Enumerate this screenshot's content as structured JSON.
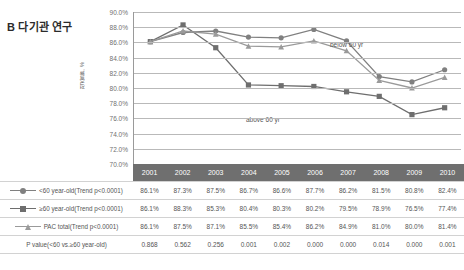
{
  "panel": {
    "title": "B 다기관 연구"
  },
  "chart_data": {
    "type": "line",
    "title": "B 다기관 연구",
    "xlabel": "",
    "ylabel": "적중률, %",
    "ylim": [
      70,
      90
    ],
    "ytick_step": 2,
    "ytick_labels": [
      "90.0%",
      "88.0%",
      "86.0%",
      "84.0%",
      "82.0%",
      "80.0%",
      "78.0%",
      "76.0%",
      "74.0%",
      "72.0%",
      "70.0%"
    ],
    "grid": true,
    "legend_position": "table-rows",
    "categories": [
      "2001",
      "2002",
      "2003",
      "2004",
      "2005",
      "2006",
      "2007",
      "2008",
      "2009",
      "2010"
    ],
    "series": [
      {
        "name": "<60 year-old(Trend p<0.0001)",
        "marker": "circle",
        "color": "#808080",
        "values": [
          86.1,
          87.3,
          87.5,
          86.7,
          86.6,
          87.7,
          86.2,
          81.5,
          80.8,
          82.4
        ],
        "display_values": [
          "86.1%",
          "87.3%",
          "87.5%",
          "86.7%",
          "86.6%",
          "87.7%",
          "86.2%",
          "81.5%",
          "80.8%",
          "82.4%"
        ]
      },
      {
        "name": "≥60 year-old(Trend p<0.0001)",
        "marker": "square",
        "color": "#6e6e6e",
        "values": [
          86.1,
          88.3,
          85.3,
          80.4,
          80.3,
          80.2,
          79.5,
          78.9,
          76.5,
          77.4
        ],
        "display_values": [
          "86.1%",
          "88.3%",
          "85.3%",
          "80.4%",
          "80.3%",
          "80.2%",
          "79.5%",
          "78.9%",
          "76.5%",
          "77.4%"
        ]
      },
      {
        "name": "PAC total(Trend p<0.0001)",
        "marker": "triangle",
        "color": "#9a9a9a",
        "values": [
          86.1,
          87.5,
          87.1,
          85.5,
          85.4,
          86.2,
          84.9,
          81.0,
          80.0,
          81.4
        ],
        "display_values": [
          "86.1%",
          "87.5%",
          "87.1%",
          "85.5%",
          "85.4%",
          "86.2%",
          "84.9%",
          "81.0%",
          "80.0%",
          "81.4%"
        ]
      }
    ],
    "extra_row": {
      "name": "P value(<60 vs.≥60 year-old)",
      "display_values": [
        "0.868",
        "0.562",
        "0.256",
        "0.001",
        "0.002",
        "0.000",
        "0.000",
        "0.014",
        "0.000",
        "0.001"
      ]
    },
    "annotations": [
      {
        "id": "below",
        "text": "below 60 yr"
      },
      {
        "id": "above",
        "text": "above 60 yr"
      }
    ]
  }
}
